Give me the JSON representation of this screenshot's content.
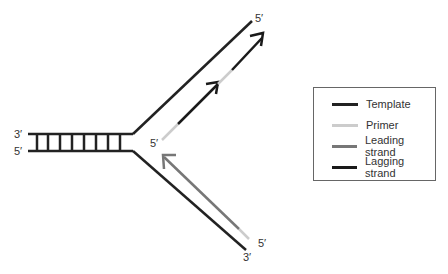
{
  "diagram": {
    "colors": {
      "template": "#222222",
      "primer": "#cccccc",
      "leading": "#777777",
      "lagging": "#1a1a1a"
    },
    "labels": {
      "duplex_top": "3′",
      "duplex_bottom": "5′",
      "upper_template_end": "5′",
      "lower_template_end": "3′",
      "lagging_start": "5′",
      "leading_start": "5′"
    }
  },
  "legend": {
    "items": [
      {
        "label": "Template",
        "color": "#222222"
      },
      {
        "label": "Primer",
        "color": "#cccccc"
      },
      {
        "label": "Leading strand",
        "color": "#777777"
      },
      {
        "label": "Lagging strand",
        "color": "#1a1a1a"
      }
    ]
  }
}
